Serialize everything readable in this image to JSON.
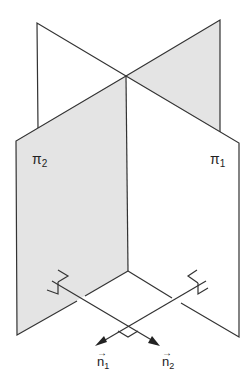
{
  "diagram": {
    "title": "",
    "planes": [
      {
        "name": "π",
        "subscript": "1",
        "label": "π1"
      },
      {
        "name": "π",
        "subscript": "2",
        "label": "π2"
      }
    ],
    "vectors": [
      {
        "name": "n",
        "subscript": "1",
        "label": "n1",
        "arrow": "→"
      },
      {
        "name": "n",
        "subscript": "2",
        "label": "n2",
        "arrow": "→"
      }
    ],
    "colors": {
      "line": "#333333",
      "shade": "#e4e4e4",
      "background": "#ffffff"
    },
    "annotations": [
      "right-angle marker between normals",
      "right-angle markers where normals meet planes"
    ]
  }
}
